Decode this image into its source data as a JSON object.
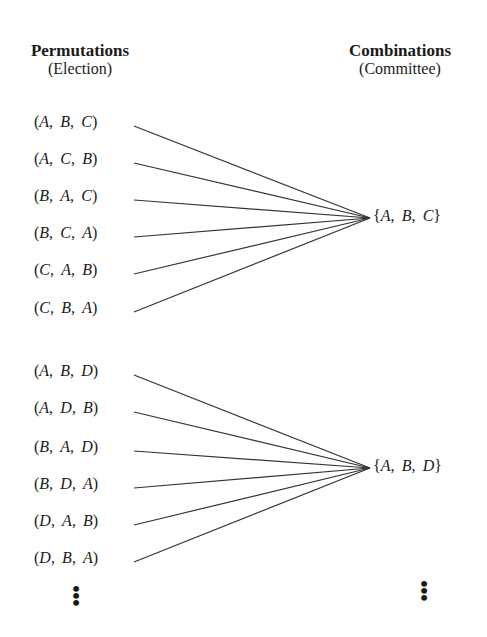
{
  "headers": {
    "permutations": {
      "title": "Permutations",
      "subtitle": "(Election)"
    },
    "combinations": {
      "title": "Combinations",
      "subtitle": "(Committee)"
    }
  },
  "groups": [
    {
      "combination": "{A, B, C}",
      "permutations": [
        "(A, B, C)",
        "(A, C, B)",
        "(B, A, C)",
        "(B, C, A)",
        "(C, A, B)",
        "(C, B, A)"
      ],
      "label_y": [
        126,
        163,
        200,
        237,
        274,
        312
      ],
      "target": [
        370,
        218
      ],
      "combo_y": 218
    },
    {
      "combination": "{A, B, D}",
      "permutations": [
        "(A, B, D)",
        "(A, D, B)",
        "(B, A, D)",
        "(B, D, A)",
        "(D, A, B)",
        "(D, B, A)"
      ],
      "label_y": [
        375,
        412,
        451,
        488,
        525,
        562
      ],
      "target": [
        370,
        468
      ],
      "combo_y": 468
    }
  ],
  "continuation": {
    "left": "⋮",
    "right": "⋮"
  },
  "style": {
    "line_color": "#333333",
    "text_color": "#1a1a1a"
  }
}
